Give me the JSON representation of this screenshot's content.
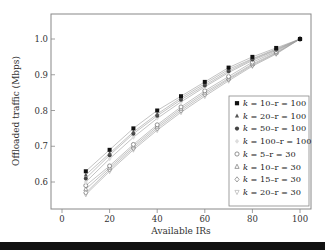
{
  "chart_data": {
    "type": "line",
    "title": "",
    "xlabel": "Available IRs",
    "ylabel": "Offloaded traffic (Mbps)",
    "xlim": [
      -5,
      105
    ],
    "ylim": [
      0.53,
      1.07
    ],
    "xticks": [
      0,
      20,
      40,
      60,
      80,
      100
    ],
    "xtick_labels": [
      "0",
      "20",
      "40",
      "60",
      "80",
      "100"
    ],
    "yticks": [
      0.6,
      0.7,
      0.8,
      0.9,
      1.0
    ],
    "ytick_labels": [
      "0.6",
      "0.7",
      "0.8",
      "0.9",
      "1.0"
    ],
    "grid": false,
    "legend_position": "lower right",
    "x": [
      10,
      20,
      30,
      40,
      50,
      60,
      70,
      80,
      90,
      100
    ],
    "series": [
      {
        "name": "k = 10–r = 100",
        "marker": "filled-square",
        "color": "#111111",
        "values": [
          0.63,
          0.69,
          0.75,
          0.8,
          0.84,
          0.88,
          0.92,
          0.95,
          0.975,
          1.0
        ]
      },
      {
        "name": "k = 20–r = 100",
        "marker": "filled-triangle",
        "color": "#555555",
        "values": [
          0.62,
          0.68,
          0.74,
          0.79,
          0.835,
          0.875,
          0.915,
          0.945,
          0.972,
          1.0
        ]
      },
      {
        "name": "k = 50–r = 100",
        "marker": "filled-circle",
        "color": "#444444",
        "values": [
          0.61,
          0.675,
          0.735,
          0.785,
          0.83,
          0.87,
          0.91,
          0.943,
          0.97,
          1.0
        ]
      },
      {
        "name": "k = 100–r = 100",
        "marker": "filled-diamond",
        "color": "#dddddd",
        "values": [
          0.6,
          0.665,
          0.725,
          0.778,
          0.824,
          0.866,
          0.906,
          0.94,
          0.968,
          1.0
        ]
      },
      {
        "name": "k = 5–r = 30",
        "marker": "open-circle",
        "color": "#777777",
        "values": [
          0.59,
          0.645,
          0.705,
          0.76,
          0.81,
          0.855,
          0.895,
          0.935,
          0.965,
          1.0
        ]
      },
      {
        "name": "k = 10–r = 30",
        "marker": "open-triangle",
        "color": "#888888",
        "values": [
          0.58,
          0.64,
          0.7,
          0.755,
          0.805,
          0.85,
          0.89,
          0.93,
          0.962,
          1.0
        ]
      },
      {
        "name": "k = 15–r = 30",
        "marker": "open-diamond",
        "color": "#888888",
        "values": [
          0.57,
          0.635,
          0.695,
          0.75,
          0.8,
          0.845,
          0.887,
          0.927,
          0.96,
          1.0
        ]
      },
      {
        "name": "k = 20–r = 30",
        "marker": "open-inverted-triangle",
        "color": "#bbbbbb",
        "values": [
          0.565,
          0.63,
          0.69,
          0.745,
          0.795,
          0.84,
          0.883,
          0.924,
          0.958,
          1.0
        ]
      }
    ]
  },
  "legend": {
    "items": [
      {
        "k": "k",
        "rest": " = 10–r = 100"
      },
      {
        "k": "k",
        "rest": " = 20–r = 100"
      },
      {
        "k": "k",
        "rest": " = 50–r = 100"
      },
      {
        "k": "k",
        "rest": " = 100–r = 100"
      },
      {
        "k": "k",
        "rest": " = 5–r = 30"
      },
      {
        "k": "k",
        "rest": " = 10–r = 30"
      },
      {
        "k": "k",
        "rest": " = 15–r = 30"
      },
      {
        "k": "k",
        "rest": " = 20–r = 30"
      }
    ]
  }
}
